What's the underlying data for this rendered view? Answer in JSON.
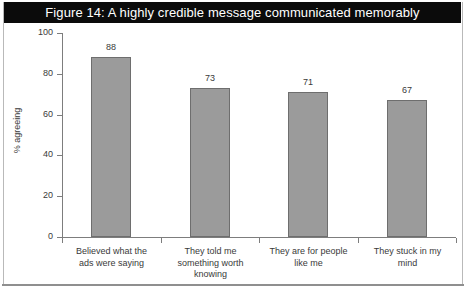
{
  "figure": {
    "title": "Figure 14: A highly credible message communicated memorably",
    "title_bar_color": "#0b0b0b",
    "title_text_color": "#ffffff",
    "frame_color": "#b9b9b9"
  },
  "chart_data": {
    "type": "bar",
    "title": "Figure 14: A highly credible message communicated memorably",
    "categories": [
      "Believed what the ads were saying",
      "They told me something worth knowing",
      "They are for people like me",
      "They stuck in my mind"
    ],
    "category_lines": [
      [
        "Believed what the",
        "ads were saying"
      ],
      [
        "They told me",
        "something worth",
        "knowing"
      ],
      [
        "They are for people",
        "like me"
      ],
      [
        "They stuck in my",
        "mind"
      ]
    ],
    "values": [
      88,
      73,
      71,
      67
    ],
    "xlabel": "",
    "ylabel": "% agreeing",
    "ylim": [
      0,
      100
    ],
    "yticks": [
      0,
      20,
      40,
      60,
      80,
      100
    ],
    "ytick_labels": [
      "0",
      "20",
      "40",
      "60",
      "80",
      "100"
    ],
    "grid": false,
    "legend": null,
    "bar_color": "#9b9b9b",
    "bar_edge_color": "#6e6e6e",
    "axis_color": "#7d7d7d",
    "text_color": "#3a3a3a",
    "show_value_labels": true
  }
}
